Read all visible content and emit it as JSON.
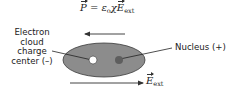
{
  "diagram": {
    "formula": {
      "lhs": "P",
      "equals": " = ",
      "epsilon": "ε",
      "epsilon_sub": "o",
      "chi": "χ",
      "field": "E",
      "field_sub": "ext"
    },
    "labels": {
      "electron_cloud": "Electron cloud charge center (–)",
      "electron_cloud_lines": [
        "Electron",
        "cloud",
        "charge",
        "center (–)"
      ],
      "nucleus": "Nucleus (+)"
    },
    "external_field": {
      "symbol": "E",
      "subscript": "ext",
      "direction": "right"
    },
    "polarization_arrow": {
      "direction": "left"
    },
    "colors": {
      "ellipse_fill": "#8c8c8c",
      "ellipse_stroke": "#3a3a3a",
      "electron_center": "#ffffff",
      "nucleus": "#5e5e5e",
      "arrow": "#3a3a3a",
      "text": "#222222"
    }
  }
}
